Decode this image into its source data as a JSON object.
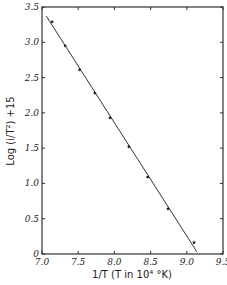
{
  "chart_data": {
    "type": "line",
    "title": "",
    "xlabel": "1/T (T in 10⁴ °K)",
    "ylabel": "Log (i/T²) +15",
    "xlim": [
      7.0,
      9.5
    ],
    "ylim": [
      0,
      3.5
    ],
    "x_ticks": [
      "7.0",
      "7.5",
      "8.0",
      "8.5",
      "9.0",
      "9.5"
    ],
    "y_ticks": [
      "0",
      "0.5",
      "1.0",
      "1.5",
      "2.0",
      "2.5",
      "3.0",
      "3.5"
    ],
    "grid": false,
    "legend": null,
    "series": [
      {
        "name": "measured points",
        "style": "markers",
        "x": [
          7.14,
          7.32,
          7.52,
          7.73,
          7.94,
          8.2,
          8.46,
          8.74,
          9.1
        ],
        "y": [
          3.29,
          2.95,
          2.61,
          2.28,
          1.93,
          1.52,
          1.09,
          0.64,
          0.16
        ]
      },
      {
        "name": "fitted line",
        "style": "line",
        "x": [
          7.06,
          9.14
        ],
        "y": [
          3.37,
          0.03
        ]
      }
    ]
  }
}
